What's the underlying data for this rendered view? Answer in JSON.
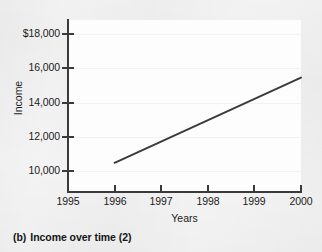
{
  "caption": {
    "marker": "(b)",
    "text": "Income over time (2)"
  },
  "chart_data": {
    "type": "line",
    "title": "",
    "xlabel": "Years",
    "ylabel": "Income",
    "x": [
      1996,
      1997,
      1998,
      1999,
      2000
    ],
    "values": [
      10500,
      11740,
      12975,
      14215,
      15450
    ],
    "series": [
      {
        "name": "Income",
        "x": [
          1996,
          2000
        ],
        "values": [
          10500,
          15450
        ]
      }
    ],
    "xlim": [
      1995,
      2000
    ],
    "ylim": [
      8800,
      18800
    ],
    "xticks": [
      1995,
      1996,
      1997,
      1998,
      1999,
      2000
    ],
    "xticklabels": [
      "1995",
      "1996",
      "1997",
      "1998",
      "1999",
      "2000"
    ],
    "yticks": [
      10000,
      12000,
      14000,
      16000,
      18000
    ],
    "yticklabels": [
      "10,000",
      "12,000",
      "14,000",
      "16,000",
      "$18,000"
    ],
    "grid": true,
    "legend": "none",
    "line_color": "#3a3a3a",
    "plot_background": "#fdfdfd",
    "page_background": "#f3f3f3"
  }
}
